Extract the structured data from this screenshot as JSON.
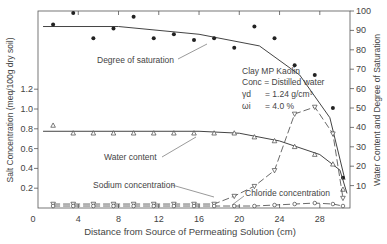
{
  "chart_data": {
    "type": "line",
    "title": "",
    "xlabel": "Distance from Source of Permeating Solution (cm)",
    "ylabel_left": "Salt Concentration (meq/100g dry soil)",
    "ylabel_right": "Water Content and Degree of Saturation",
    "xlim": [
      0,
      31
    ],
    "ylim_left": [
      0,
      1.4
    ],
    "ylim_right": [
      0,
      100
    ],
    "x_ticks": [
      "0",
      "4",
      "8",
      "12",
      "16",
      "20",
      "24",
      "28"
    ],
    "y_left_ticks": [
      "0.2",
      "0.4",
      "0.6",
      "0.8",
      "1.0",
      "1.2"
    ],
    "y_right_ticks": [
      "10",
      "20",
      "30",
      "40",
      "50",
      "60",
      "70",
      "80",
      "90",
      "100"
    ],
    "grid": false,
    "annotation_box": {
      "line1": "Clay MP  Kaolin",
      "line2": "Conc = Distilled water",
      "line3_symbol": "γd",
      "line3": "=  1.24 g/cm³",
      "line4_symbol": "ωi",
      "line4": "=  4.0 %"
    },
    "series": [
      {
        "name": "Degree of saturation",
        "axis": "right",
        "marker": "filled-circle",
        "points": [
          [
            1.5,
            93
          ],
          [
            3.5,
            99
          ],
          [
            5.5,
            86
          ],
          [
            7.5,
            91
          ],
          [
            9.5,
            97
          ],
          [
            11.5,
            86
          ],
          [
            13.5,
            88
          ],
          [
            15.5,
            85
          ],
          [
            17.5,
            86
          ],
          [
            19.5,
            81
          ],
          [
            21.5,
            92
          ],
          [
            23.5,
            86
          ],
          [
            25.5,
            72
          ],
          [
            27.5,
            67
          ],
          [
            29.3,
            50
          ],
          [
            30.3,
            14
          ]
        ],
        "fit": [
          [
            0.5,
            92
          ],
          [
            8,
            92
          ],
          [
            16,
            88
          ],
          [
            22,
            82
          ],
          [
            26,
            67
          ],
          [
            29,
            45
          ],
          [
            30.5,
            13
          ]
        ]
      },
      {
        "name": "Water content",
        "axis": "right",
        "marker": "open-triangle",
        "points": [
          [
            1.5,
            41
          ],
          [
            3.5,
            37
          ],
          [
            5.5,
            37
          ],
          [
            7.5,
            37
          ],
          [
            9.5,
            37
          ],
          [
            11.5,
            37
          ],
          [
            13.5,
            37
          ],
          [
            15.5,
            37
          ],
          [
            17.5,
            37
          ],
          [
            19.5,
            37
          ],
          [
            21.5,
            35
          ],
          [
            23.5,
            33
          ],
          [
            25.5,
            30
          ],
          [
            27.5,
            26
          ],
          [
            29.3,
            21
          ],
          [
            30.3,
            8
          ]
        ],
        "fit": [
          [
            0.5,
            38
          ],
          [
            16,
            38
          ],
          [
            20,
            37
          ],
          [
            24,
            33
          ],
          [
            28,
            26
          ],
          [
            30,
            18
          ],
          [
            30.7,
            6
          ]
        ]
      },
      {
        "name": "Sodium concentration",
        "axis": "left",
        "marker": "open-inverted-triangle",
        "points": [
          [
            1.5,
            0.04
          ],
          [
            3.5,
            0.04
          ],
          [
            5.5,
            0.04
          ],
          [
            7.5,
            0.04
          ],
          [
            9.5,
            0.04
          ],
          [
            11.5,
            0.04
          ],
          [
            13.5,
            0.04
          ],
          [
            15.5,
            0.04
          ],
          [
            17.5,
            0.04
          ],
          [
            19.5,
            0.12
          ],
          [
            21.5,
            0.22
          ],
          [
            23.5,
            0.38
          ],
          [
            25.5,
            0.95
          ],
          [
            27.5,
            1.02
          ],
          [
            29.3,
            0.75
          ],
          [
            30.3,
            0.1
          ]
        ]
      },
      {
        "name": "Chloride concentration",
        "axis": "left",
        "marker": "open-circle",
        "points": [
          [
            1.5,
            0.02
          ],
          [
            3.5,
            0.02
          ],
          [
            5.5,
            0.02
          ],
          [
            7.5,
            0.02
          ],
          [
            9.5,
            0.02
          ],
          [
            11.5,
            0.02
          ],
          [
            13.5,
            0.02
          ],
          [
            15.5,
            0.02
          ],
          [
            17.5,
            0.02
          ],
          [
            19.5,
            0.02
          ],
          [
            21.5,
            0.02
          ],
          [
            23.5,
            0.03
          ],
          [
            25.5,
            0.04
          ],
          [
            27.5,
            0.05
          ],
          [
            29.3,
            0.04
          ],
          [
            30.3,
            0.02
          ]
        ]
      }
    ],
    "labels": {
      "degree_of_saturation": "Degree of saturation",
      "water_content": "Water content",
      "sodium": "Sodium concentration",
      "chloride": "Chloride concentration"
    }
  }
}
